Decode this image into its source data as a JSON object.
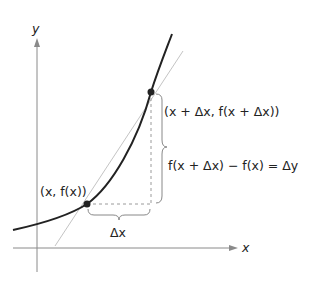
{
  "diagram": {
    "axes": {
      "x_label": "x",
      "y_label": "y"
    },
    "points": [
      {
        "id": "p1",
        "label": "(x, f(x))"
      },
      {
        "id": "p2",
        "label": "(x + Δx, f(x + Δx))"
      }
    ],
    "annotations": {
      "delta_x": "Δx",
      "delta_y": "f(x + Δx) − f(x) = Δy"
    },
    "colors": {
      "curve": "#222222",
      "secant": "#bdbdbd",
      "axis": "#8a8a8a",
      "dashed": "#9a9a9a"
    }
  }
}
